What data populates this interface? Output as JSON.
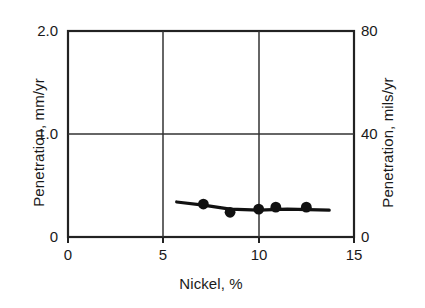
{
  "chart_data": {
    "type": "line",
    "title": "",
    "xlabel": "Nickel, %",
    "ylabel": "Penetration, mm/yr",
    "y2label": "Penetration, mils/yr",
    "xlim": [
      0,
      15
    ],
    "ylim": [
      0,
      2.0
    ],
    "y2lim": [
      0,
      80
    ],
    "grid": true,
    "legend": "none",
    "xticks": [
      "0",
      "5",
      "10",
      "15"
    ],
    "xtick_values": [
      0,
      5,
      10,
      15
    ],
    "yticks": [
      "0",
      "1.0",
      "2.0"
    ],
    "ytick_values": [
      0,
      1.0,
      2.0
    ],
    "y2ticks": [
      "0",
      "40",
      "80"
    ],
    "y2tick_values": [
      0,
      40,
      80
    ],
    "series": [
      {
        "name": "Penetration vs Nickel",
        "marker": "filled-circle",
        "x": [
          7.1,
          8.5,
          10.0,
          10.9,
          12.5
        ],
        "y": [
          0.32,
          0.24,
          0.27,
          0.29,
          0.29
        ],
        "y_mils": [
          12.8,
          9.6,
          10.8,
          11.6,
          11.6
        ],
        "trend_x": [
          5.7,
          7.1,
          8.5,
          10.0,
          11.5,
          13.7
        ],
        "trend_y": [
          0.34,
          0.31,
          0.27,
          0.26,
          0.27,
          0.26
        ]
      }
    ]
  },
  "axes": {
    "x_title": "Nickel, %",
    "y_left_title": "Penetration, mm/yr",
    "y_right_title": "Penetration, mils/yr"
  },
  "ticks": {
    "x": [
      "0",
      "5",
      "10",
      "15"
    ],
    "y_left": [
      "0",
      "1.0",
      "2.0"
    ],
    "y_right": [
      "0",
      "40",
      "80"
    ]
  },
  "colors": {
    "line": "#111111",
    "marker": "#111111",
    "frame": "#222222",
    "grid": "#333333",
    "background": "#ffffff"
  }
}
